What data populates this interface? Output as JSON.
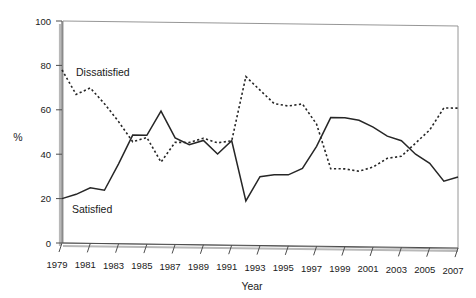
{
  "chart_data": {
    "type": "line",
    "title": "",
    "xlabel": "Year",
    "ylabel": "%",
    "xlim": [
      1979,
      2007
    ],
    "ylim": [
      0,
      100
    ],
    "grid": false,
    "legend_position": "inline-annotations",
    "x": [
      1979,
      1980,
      1981,
      1982,
      1983,
      1984,
      1985,
      1986,
      1987,
      1988,
      1989,
      1990,
      1991,
      1992,
      1993,
      1994,
      1995,
      1996,
      1997,
      1998,
      1999,
      2000,
      2001,
      2002,
      2003,
      2004,
      2005,
      2006,
      2007
    ],
    "y_ticks": [
      0,
      20,
      40,
      60,
      80,
      100
    ],
    "x_ticks": [
      1979,
      1981,
      1983,
      1985,
      1987,
      1989,
      1991,
      1993,
      1995,
      1997,
      1999,
      2001,
      2003,
      2005,
      2007
    ],
    "x_tick_labels": [
      "1979",
      "1981",
      "1983",
      "1985",
      "1987",
      "1989",
      "1991",
      "1993",
      "1995",
      "1997",
      "1999",
      "2001",
      "2003",
      "2005",
      "2007"
    ],
    "y_tick_labels": [
      "0",
      "20",
      "40",
      "60",
      "80",
      "100"
    ],
    "series": [
      {
        "name": "Dissatisfied",
        "style": "dashed",
        "color": "#262626",
        "label_text": "Dissatisfied",
        "values": [
          78,
          67,
          70,
          63,
          55,
          46,
          48,
          37,
          46,
          46,
          48,
          46,
          47,
          76,
          70,
          64,
          63,
          64,
          55,
          35,
          35,
          34,
          36,
          40,
          41,
          47,
          53,
          63,
          63
        ]
      },
      {
        "name": "Satisfied",
        "style": "solid",
        "color": "#262626",
        "label_text": "Satisfied",
        "values": [
          20,
          22,
          25,
          24,
          36,
          49,
          49,
          60,
          48,
          45,
          47,
          41,
          47,
          20,
          31,
          32,
          32,
          35,
          45,
          58,
          58,
          57,
          54,
          50,
          48,
          42,
          38,
          30,
          32
        ]
      }
    ],
    "annotations": [
      {
        "text": "Dissatisfied",
        "x_px": 76,
        "y_px": 72
      },
      {
        "text": "Satisfied",
        "x_px": 72,
        "y_px": 209
      }
    ]
  },
  "axis": {
    "y_label": "%",
    "x_label": "Year"
  }
}
